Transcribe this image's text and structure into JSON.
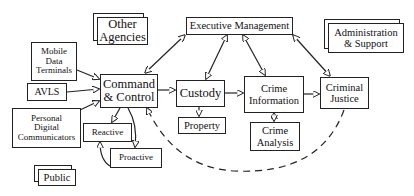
{
  "nodes": {
    "other_agencies": "Other Agencies",
    "executive_management": "Executive Management",
    "administration_support": "Administration & Support",
    "mobile_data_terminals": "Mobile Data Terminals",
    "avls": "AVLS",
    "command_control": "Command & Control",
    "custody": "Custody",
    "crime_information": "Crime Information",
    "criminal_justice": "Criminal Justice",
    "property": "Property",
    "personal_digital_communicators": "Personal Digital Communicators",
    "reactive": "Reactive",
    "proactive": "Proactive",
    "crime_analysis": "Crime Analysis",
    "public": "Public"
  },
  "edges": [
    {
      "from": "Mobile Data Terminals",
      "to": "Command & Control",
      "style": "solid",
      "direction": "forward"
    },
    {
      "from": "AVLS",
      "to": "Command & Control",
      "style": "solid",
      "direction": "forward"
    },
    {
      "from": "Personal Digital Communicators",
      "to": "Command & Control",
      "style": "solid",
      "direction": "forward"
    },
    {
      "from": "Command & Control",
      "to": "Executive Management",
      "style": "solid",
      "direction": "both"
    },
    {
      "from": "Custody",
      "to": "Executive Management",
      "style": "solid",
      "direction": "both"
    },
    {
      "from": "Crime Information",
      "to": "Executive Management",
      "style": "solid",
      "direction": "both"
    },
    {
      "from": "Criminal Justice",
      "to": "Executive Management",
      "style": "solid",
      "direction": "both"
    },
    {
      "from": "Command & Control",
      "to": "Custody",
      "style": "solid",
      "direction": "forward"
    },
    {
      "from": "Custody",
      "to": "Crime Information",
      "style": "solid",
      "direction": "forward"
    },
    {
      "from": "Crime Information",
      "to": "Criminal Justice",
      "style": "solid",
      "direction": "forward"
    },
    {
      "from": "Custody",
      "to": "Property",
      "style": "solid",
      "direction": "forward"
    },
    {
      "from": "Crime Information",
      "to": "Crime Analysis",
      "style": "solid",
      "direction": "both"
    },
    {
      "from": "Command & Control",
      "to": "Reactive",
      "style": "solid",
      "direction": "forward"
    },
    {
      "from": "Command & Control",
      "to": "Proactive",
      "style": "solid",
      "direction": "forward"
    },
    {
      "from": "Proactive",
      "to": "Reactive",
      "style": "solid",
      "direction": "forward"
    },
    {
      "from": "Criminal Justice",
      "to": "Command & Control",
      "style": "dashed",
      "direction": "forward"
    }
  ]
}
